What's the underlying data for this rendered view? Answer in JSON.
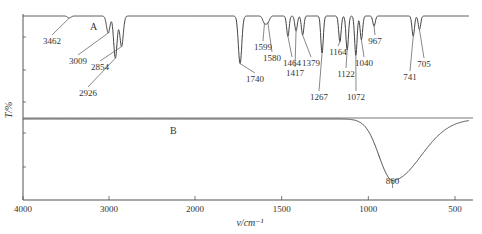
{
  "chart_data": {
    "type": "line",
    "title": "",
    "xlabel": "v/cm⁻¹",
    "ylabel": "T/%",
    "xlim": [
      4000,
      420
    ],
    "x_ticks": [
      4000,
      3000,
      2000,
      1500,
      1000,
      500
    ],
    "x_tick_labels": [
      "4000",
      "3000",
      "2000",
      "1500",
      "1000",
      "500"
    ],
    "scale_note": "x-axis scale doubles below 2000 cm⁻¹",
    "grid": false,
    "legend": "none",
    "series": [
      {
        "name": "A",
        "label": "A",
        "panel": "upper",
        "peaks": [
          {
            "x": 3462,
            "label": "3462",
            "depth": 0.03
          },
          {
            "x": 3009,
            "label": "3009",
            "depth": 0.25
          },
          {
            "x": 2926,
            "label": "2926",
            "depth": 0.62
          },
          {
            "x": 2854,
            "label": "2854",
            "depth": 0.45
          },
          {
            "x": 1740,
            "label": "1740",
            "depth": 0.7
          },
          {
            "x": 1599,
            "label": "1599",
            "depth": 0.1
          },
          {
            "x": 1580,
            "label": "1580",
            "depth": 0.09
          },
          {
            "x": 1464,
            "label": "1464",
            "depth": 0.3
          },
          {
            "x": 1417,
            "label": "1417",
            "depth": 0.22
          },
          {
            "x": 1379,
            "label": "1379",
            "depth": 0.28
          },
          {
            "x": 1267,
            "label": "1267",
            "depth": 0.55
          },
          {
            "x": 1164,
            "label": "1164",
            "depth": 0.38
          },
          {
            "x": 1122,
            "label": "1122",
            "depth": 0.5
          },
          {
            "x": 1072,
            "label": "1072",
            "depth": 0.58
          },
          {
            "x": 1040,
            "label": "1040",
            "depth": 0.35
          },
          {
            "x": 967,
            "label": "967",
            "depth": 0.15
          },
          {
            "x": 741,
            "label": "741",
            "depth": 0.3
          },
          {
            "x": 705,
            "label": "705",
            "depth": 0.2
          }
        ]
      },
      {
        "name": "B",
        "label": "B",
        "panel": "lower",
        "peaks": [
          {
            "x": 860,
            "label": "860",
            "depth": 0.85
          }
        ]
      }
    ]
  }
}
